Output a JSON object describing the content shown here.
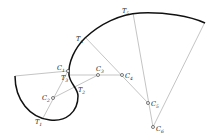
{
  "diagram": {
    "labels": {
      "C1": {
        "main": "C",
        "sub": "1"
      },
      "C2": {
        "main": "C",
        "sub": "2"
      },
      "C3": {
        "main": "C",
        "sub": "3"
      },
      "C4": {
        "main": "C",
        "sub": "4"
      },
      "C5": {
        "main": "C",
        "sub": "5"
      },
      "C6": {
        "main": "C",
        "sub": "6"
      },
      "T1": {
        "main": "T",
        "sub": "1"
      },
      "T2": {
        "main": "T",
        "sub": "2"
      },
      "T3": {
        "main": "T",
        "sub": "3"
      },
      "T4": {
        "main": "T",
        "sub": "4"
      },
      "T5": {
        "main": "T",
        "sub": "5"
      }
    },
    "colors": {
      "curve": "#111111",
      "construction": "#777777",
      "text": "#222222"
    }
  }
}
